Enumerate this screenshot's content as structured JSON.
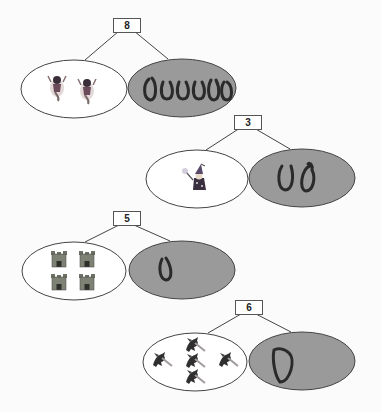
{
  "colors": {
    "left_fill": "#ffffff",
    "right_fill": "#9a9a9a",
    "stroke": "#444444",
    "ink": "#2a2a2a"
  },
  "groups": [
    {
      "total": "8",
      "left": {
        "icon": "fairy-icon",
        "count": 2
      },
      "right": {
        "handwritten": "000000",
        "count": 6
      }
    },
    {
      "total": "3",
      "left": {
        "icon": "wizard-icon",
        "count": 1
      },
      "right": {
        "handwritten": "00",
        "count": 2
      }
    },
    {
      "total": "5",
      "left": {
        "icon": "castle-icon",
        "count": 4
      },
      "right": {
        "handwritten": "0",
        "count": 1
      }
    },
    {
      "total": "6",
      "left": {
        "icon": "dragon-icon",
        "count": 5
      },
      "right": {
        "handwritten": "0",
        "count": 1
      }
    }
  ]
}
